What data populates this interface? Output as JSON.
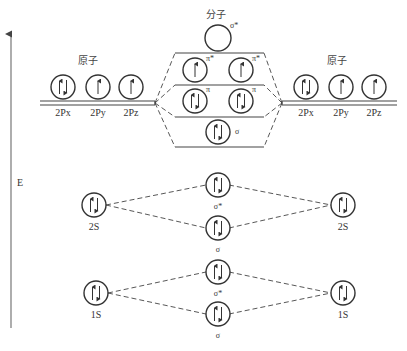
{
  "diagram": {
    "type": "molecular-orbital-energy-diagram",
    "axis": {
      "label": "E"
    },
    "atom_label_left": "原子",
    "atom_label_right": "原子",
    "molecule_label": "分子",
    "left_atom": {
      "p_orbitals": [
        {
          "label": "2Px",
          "electrons": "↑↓"
        },
        {
          "label": "2Py",
          "electrons": "↑"
        },
        {
          "label": "2Pz",
          "electrons": "↑"
        }
      ],
      "s2": {
        "label": "2S",
        "electrons": "↑↓"
      },
      "s1": {
        "label": "1S",
        "electrons": "↑↓"
      }
    },
    "right_atom": {
      "p_orbitals": [
        {
          "label": "2Px",
          "electrons": "↑↓"
        },
        {
          "label": "2Py",
          "electrons": "↑"
        },
        {
          "label": "2Pz",
          "electrons": "↑"
        }
      ],
      "s2": {
        "label": "2S",
        "electrons": "↑↓"
      },
      "s1": {
        "label": "1S",
        "electrons": "↑↓"
      }
    },
    "molecular_orbitals": {
      "sigma_star_2p": {
        "label": "σ*",
        "electrons": ""
      },
      "pi_star_2p": [
        {
          "label": "π*",
          "electrons": "↑"
        },
        {
          "label": "π*",
          "electrons": "↑"
        }
      ],
      "pi_2p": [
        {
          "label": "π",
          "electrons": "↑↓"
        },
        {
          "label": "π",
          "electrons": "↑↓"
        }
      ],
      "sigma_2p": {
        "label": "σ",
        "electrons": "↑↓"
      },
      "sigma_star_2s": {
        "label": "σ*",
        "electrons": "↑↓"
      },
      "sigma_2s": {
        "label": "σ",
        "electrons": "↑↓"
      },
      "sigma_star_1s": {
        "label": "σ*",
        "electrons": "↑↓"
      },
      "sigma_1s": {
        "label": "σ",
        "electrons": "↑↓"
      }
    }
  }
}
